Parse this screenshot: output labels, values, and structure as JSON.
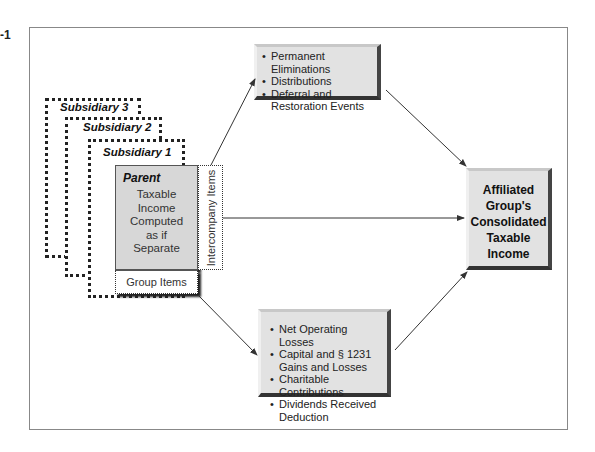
{
  "figure": {
    "number_label": "-1"
  },
  "subsidiaries": [
    {
      "label": "Subsidiary 3"
    },
    {
      "label": "Subsidiary 2"
    },
    {
      "label": "Subsidiary 1"
    }
  ],
  "parent": {
    "title": "Parent",
    "body_lines": [
      "Taxable",
      "Income",
      "Computed",
      "as if",
      "Separate"
    ]
  },
  "side_tabs": {
    "intercompany": "Intercompany Items",
    "group": "Group Items"
  },
  "top_box": {
    "items": [
      "Permanent Eliminations",
      "Distributions",
      "Deferral and Restoration Events"
    ]
  },
  "bottom_box": {
    "items": [
      "Net Operating Losses",
      "Capital and § 1231 Gains and Losses",
      "Charitable Contributions",
      "Dividends Received Deduction"
    ]
  },
  "result_box": {
    "lines": [
      "Affiliated",
      "Group's",
      "Consolidated",
      "Taxable",
      "Income"
    ]
  },
  "colors": {
    "box_fill": "#e2e2e2",
    "parent_fill": "#d7d7d7",
    "frame": "#888888",
    "arrow": "#333333"
  }
}
